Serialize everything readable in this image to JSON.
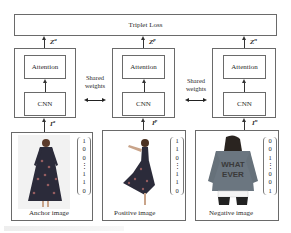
{
  "diagram": {
    "loss": {
      "label": "Triplet Loss"
    },
    "branches": [
      {
        "id": "anchor",
        "output_var": "Z",
        "output_sup": "a",
        "input_var": "I",
        "input_sup": "a",
        "attention_label": "Attention",
        "cnn_label": "CNN",
        "image_caption": "Anchor image",
        "image_desc": "woman in long floral dress",
        "vector": [
          "1",
          "0",
          "0",
          "⋮",
          "1",
          "1",
          "0"
        ]
      },
      {
        "id": "positive",
        "output_var": "Z",
        "output_sup": "p",
        "input_var": "I",
        "input_sup": "p",
        "attention_label": "Attention",
        "cnn_label": "CNN",
        "image_caption": "Positive image",
        "image_desc": "woman in floral dress twirling",
        "vector": [
          "1",
          "1",
          "0",
          "⋮",
          "1",
          "1",
          "0"
        ]
      },
      {
        "id": "negative",
        "output_var": "Z",
        "output_sup": "n",
        "input_var": "I",
        "input_sup": "n",
        "attention_label": "Attention",
        "cnn_label": "CNN",
        "image_caption": "Negative image",
        "image_desc": "back of woman in denim jacket reading WHAT EVER",
        "jacket_text_1": "WHAT",
        "jacket_text_2": "EVER",
        "vector": [
          "0",
          "0",
          "1",
          "⋮",
          "0",
          "0",
          "1"
        ]
      }
    ],
    "shared_weights": [
      {
        "line1": "Shared",
        "line2": "weights"
      },
      {
        "line1": "Shared",
        "line2": "weights"
      }
    ]
  }
}
